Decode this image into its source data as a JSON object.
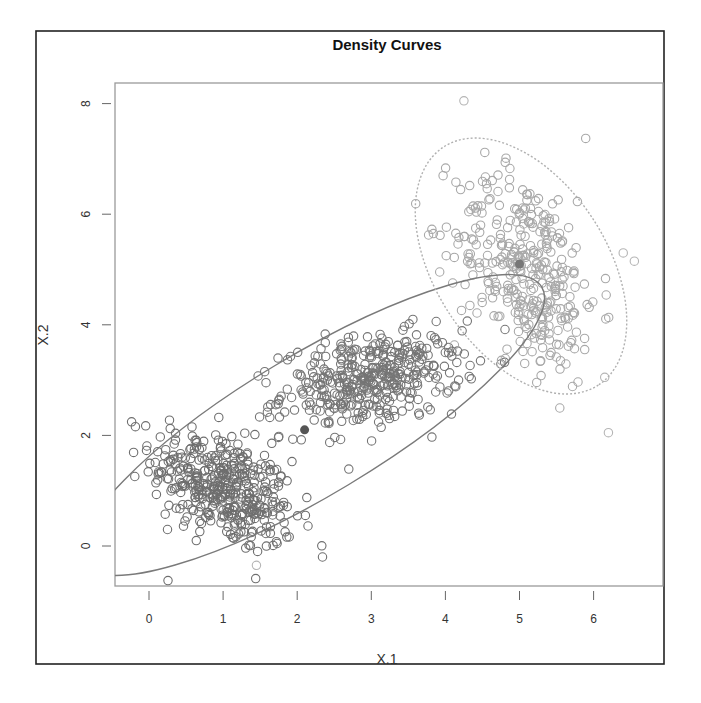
{
  "chart_data": {
    "type": "scatter",
    "title": "Density Curves",
    "xlabel": "X.1",
    "ylabel": "X.2",
    "x_ticks": [
      0,
      1,
      2,
      3,
      4,
      5,
      6
    ],
    "y_ticks": [
      0,
      2,
      4,
      6,
      8
    ],
    "xlim": [
      -0.46,
      6.94
    ],
    "ylim": [
      -0.72,
      8.37
    ],
    "grid": false,
    "legend": null,
    "series": [
      {
        "name": "cluster-1",
        "center": [
          1.0,
          1.05
        ],
        "sd": [
          0.48,
          0.55
        ],
        "correlation": -0.45,
        "n": 420,
        "color": "#6e6e6e"
      },
      {
        "name": "cluster-2",
        "center": [
          3.0,
          3.0
        ],
        "sd": [
          0.6,
          0.42
        ],
        "correlation": 0.3,
        "n": 420,
        "color": "#757575"
      },
      {
        "name": "cluster-3",
        "center": [
          5.1,
          5.0
        ],
        "sd": [
          0.48,
          0.9
        ],
        "correlation": -0.35,
        "n": 360,
        "color": "#a8a8a8"
      }
    ],
    "outliers": [
      [
        4.25,
        8.05
      ],
      [
        6.2,
        2.05
      ],
      [
        6.4,
        5.3
      ],
      [
        6.55,
        5.15
      ],
      [
        6.15,
        3.05
      ],
      [
        1.45,
        -0.35
      ]
    ],
    "centers": [
      {
        "name": "center-ellipse-1",
        "x": 2.1,
        "y": 2.1,
        "color": "#555555"
      },
      {
        "name": "center-ellipse-2",
        "x": 5.0,
        "y": 5.1,
        "color": "#777777"
      }
    ],
    "ellipses": [
      {
        "name": "ellipse-1",
        "cx_px": 312,
        "cy_px": 425,
        "rx_px": 268,
        "ry_px": 70,
        "angle_deg": -31,
        "stroke": "#7a7a7a",
        "dash": "none"
      },
      {
        "name": "ellipse-2",
        "cx_px": 521,
        "cy_px": 266,
        "rx_px": 142,
        "ry_px": 86,
        "angle_deg": 57,
        "stroke": "#b0b0b0",
        "dash": "2,2"
      }
    ]
  }
}
